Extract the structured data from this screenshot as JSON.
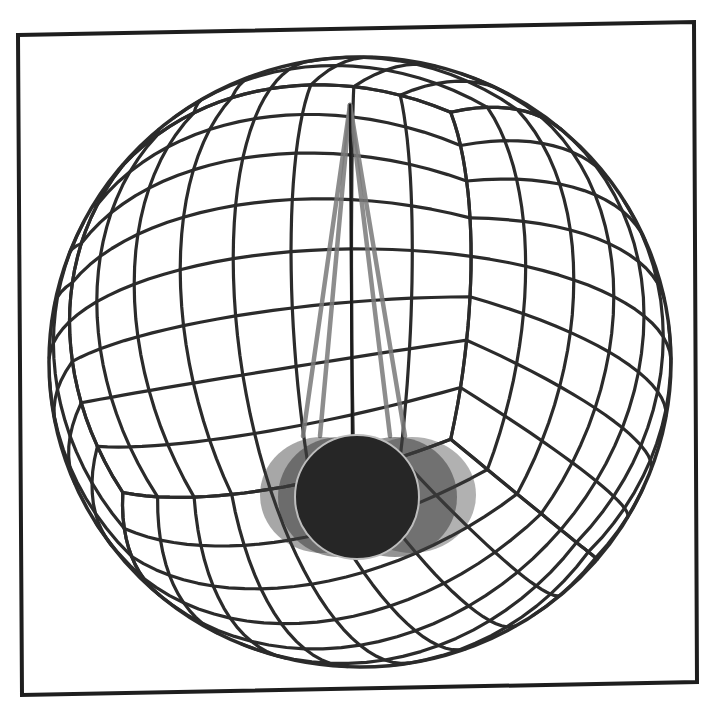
{
  "figure": {
    "frame": {
      "corners": [
        [
          18,
          35
        ],
        [
          694,
          22
        ],
        [
          697,
          682
        ],
        [
          22,
          695
        ]
      ],
      "stroke_color": "#1e1e1e"
    },
    "sphere": {
      "center": [
        360,
        362
      ],
      "radius_x": 311,
      "radius_y": 305,
      "grid_divisions_per_face": 8,
      "line_color": "#2b2b2b",
      "visible_cube_corner_top": [
        280,
        210
      ],
      "visible_cube_corner_bottom": [
        330,
        610
      ]
    },
    "pendulum": {
      "pivot": [
        350,
        105
      ],
      "main_string_end": [
        352,
        436
      ],
      "ghost_string_ends": [
        [
          303,
          436
        ],
        [
          320,
          436
        ],
        [
          390,
          436
        ],
        [
          405,
          436
        ]
      ],
      "string_color": "#1a1a1a",
      "ghost_string_color": "#7a7a7a",
      "bob": {
        "center": [
          357,
          497
        ],
        "radius": 62,
        "fill": "#262626",
        "outline": "#bdbdbd"
      },
      "ghost_bobs": [
        {
          "center": [
            322,
            495
          ],
          "rx": 62,
          "ry": 58,
          "opacity": 0.45
        },
        {
          "center": [
            340,
            497
          ],
          "rx": 62,
          "ry": 60,
          "opacity": 0.55
        },
        {
          "center": [
            395,
            497
          ],
          "rx": 62,
          "ry": 60,
          "opacity": 0.55
        },
        {
          "center": [
            412,
            495
          ],
          "rx": 64,
          "ry": 58,
          "opacity": 0.4
        }
      ],
      "ghost_color": "#3c3c3c"
    }
  }
}
